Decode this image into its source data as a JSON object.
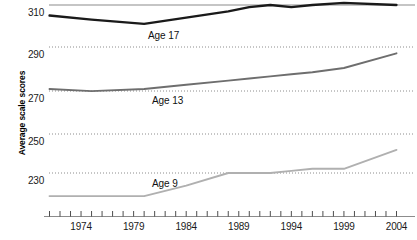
{
  "axis": {
    "ylabel": "Average scale scores",
    "yticks": [
      {
        "value": 310,
        "label": "310",
        "y": 5.0,
        "style": "solid"
      },
      {
        "value": 290,
        "label": "290",
        "y": 47.0,
        "style": "dotted"
      },
      {
        "value": 270,
        "label": "270",
        "y": 91.0,
        "style": "dotted"
      },
      {
        "value": 250,
        "label": "250",
        "y": 134.0,
        "style": "dotted"
      },
      {
        "value": 230,
        "label": "230",
        "y": 173.0,
        "style": "dotted"
      }
    ],
    "xticks": [
      {
        "year": 1971
      },
      {
        "year": 1972
      },
      {
        "year": 1973
      },
      {
        "year": 1974,
        "label": "1974"
      },
      {
        "year": 1975
      },
      {
        "year": 1976
      },
      {
        "year": 1977
      },
      {
        "year": 1978
      },
      {
        "year": 1979,
        "label": "1979"
      },
      {
        "year": 1980
      },
      {
        "year": 1981
      },
      {
        "year": 1982
      },
      {
        "year": 1983
      },
      {
        "year": 1984,
        "label": "1984"
      },
      {
        "year": 1985
      },
      {
        "year": 1986
      },
      {
        "year": 1987
      },
      {
        "year": 1988
      },
      {
        "year": 1989,
        "label": "1989"
      },
      {
        "year": 1990
      },
      {
        "year": 1991
      },
      {
        "year": 1992
      },
      {
        "year": 1993
      },
      {
        "year": 1994,
        "label": "1994"
      },
      {
        "year": 1995
      },
      {
        "year": 1996
      },
      {
        "year": 1997
      },
      {
        "year": 1998
      },
      {
        "year": 1999,
        "label": "1999"
      },
      {
        "year": 2000
      },
      {
        "year": 2001
      },
      {
        "year": 2002
      },
      {
        "year": 2003
      },
      {
        "year": 2004,
        "label": "2004"
      }
    ],
    "xmin": 1971,
    "xmax": 2004
  },
  "series_labels": {
    "age17": "Age 17",
    "age13": "Age 13",
    "age9": "Age 9"
  },
  "colors": {
    "age17": "#1a1a1a",
    "age13": "#6e6e6e",
    "age9": "#b0b0b0",
    "gridline": "#8c8c8c",
    "axis": "#8c8c8c"
  },
  "chart_data": {
    "type": "line",
    "title": "",
    "xlabel": "",
    "ylabel": "Average scale scores",
    "xlim": [
      1971,
      2004
    ],
    "ylim": [
      218,
      312
    ],
    "grid": true,
    "legend": "inline-labels",
    "categories": [
      1971,
      1975,
      1980,
      1984,
      1988,
      1990,
      1992,
      1994,
      1996,
      1999,
      2004
    ],
    "series": [
      {
        "name": "Age 17",
        "color": "#1a1a1a",
        "x": [
          1971,
          1975,
          1980,
          1984,
          1988,
          1990,
          1992,
          1994,
          1996,
          1999,
          2004
        ],
        "values": [
          305,
          303,
          301,
          304,
          307,
          309,
          310,
          309,
          310,
          311,
          310
        ]
      },
      {
        "name": "Age 13",
        "color": "#6e6e6e",
        "x": [
          1971,
          1975,
          1980,
          1984,
          1988,
          1990,
          1992,
          1994,
          1996,
          1999,
          2004
        ],
        "values": [
          270,
          269,
          270,
          272,
          274,
          275,
          276,
          277,
          278,
          280,
          287
        ]
      },
      {
        "name": "Age 9",
        "color": "#b0b0b0",
        "x": [
          1971,
          1975,
          1980,
          1984,
          1988,
          1990,
          1992,
          1994,
          1996,
          1999,
          2004
        ],
        "values": [
          219,
          219,
          219,
          224,
          230,
          230,
          230,
          231,
          232,
          232,
          241
        ]
      }
    ]
  }
}
